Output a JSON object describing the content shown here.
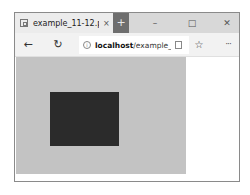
{
  "browser": {
    "tab": {
      "title": "example_11-12.php",
      "close_glyph": "×",
      "favicon": "page-icon"
    },
    "new_tab_glyph": "+",
    "window_controls": {
      "minimize": "–",
      "maximize": "□",
      "close": "✕"
    },
    "nav": {
      "back_glyph": "←",
      "refresh_glyph": "↻"
    },
    "address_bar": {
      "info_glyph": "i",
      "host": "localhost",
      "path": "/example_11"
    },
    "favorite_glyph": "☆",
    "more_glyph": "···"
  },
  "page": {
    "outer_box_color": "#c3c3c3",
    "inner_box_color": "#2b2b2b"
  }
}
